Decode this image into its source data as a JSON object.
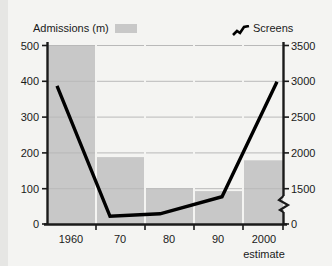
{
  "chart_data": {
    "type": "bar",
    "title": "",
    "categories": [
      "1960",
      "70",
      "80",
      "90",
      "2000"
    ],
    "xlabel": "",
    "x_note": "estimate",
    "series": [
      {
        "name": "Admissions (m)",
        "type": "bar",
        "axis": "left",
        "values": [
          500,
          187,
          100,
          92,
          178
        ],
        "color": "#c8c8c8"
      },
      {
        "name": "Screens",
        "type": "line",
        "axis": "right",
        "values": [
          3020,
          1490,
          1520,
          1720,
          3070
        ],
        "color": "#000000"
      }
    ],
    "left_axis": {
      "label": "Admissions (m)",
      "ticks": [
        "0",
        "100",
        "200",
        "300",
        "400",
        "500"
      ],
      "tick_values": [
        0,
        100,
        200,
        300,
        400,
        500
      ],
      "ylim": [
        0,
        500
      ]
    },
    "right_axis": {
      "label": "Screens",
      "ticks": [
        "0",
        "1500",
        "2000",
        "2500",
        "3000",
        "3500"
      ],
      "tick_values": [
        0,
        1500,
        2000,
        2500,
        3000,
        3500
      ],
      "ylim": [
        1400,
        3500
      ],
      "axis_break": true,
      "axis_break_note": "broken axis between 0 and 1500"
    },
    "grid": true,
    "legend_position": "top"
  },
  "legend": {
    "admissions_label": "Admissions (m)",
    "screens_label": "Screens"
  },
  "axis": {
    "left_ticks": [
      "500",
      "400",
      "300",
      "200",
      "100",
      "0"
    ],
    "right_ticks": [
      "3500",
      "3000",
      "2500",
      "2000",
      "1500",
      "0"
    ],
    "x_ticks": [
      "1960",
      "70",
      "80",
      "90",
      "2000"
    ],
    "estimate_note": "estimate"
  },
  "colors": {
    "bar": "#c8c8c8",
    "line": "#000000",
    "grid": "#bdbdbd",
    "axis": "#1a1a1a",
    "background": "#f4f4f2"
  }
}
